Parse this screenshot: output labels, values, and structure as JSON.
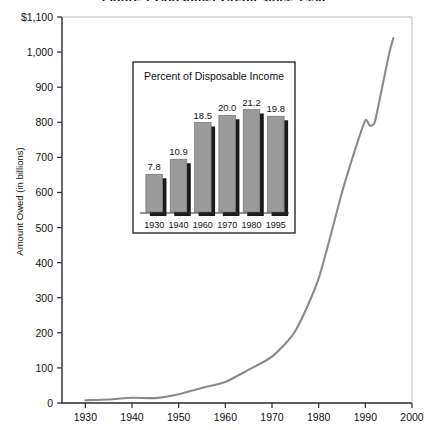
{
  "chart_data": {
    "type": "line",
    "title": "Figure 1   Consumer Credit since 1930",
    "xlabel": "",
    "ylabel": "Amount Owed (in billions)",
    "xlim": [
      1925,
      2000
    ],
    "ylim": [
      0,
      1100
    ],
    "grid": false,
    "legend": null,
    "y_ticks": [
      "$1,100",
      "1,000",
      "900",
      "800",
      "700",
      "600",
      "500",
      "400",
      "300",
      "200",
      "100",
      "0"
    ],
    "y_tick_values": [
      1100,
      1000,
      900,
      800,
      700,
      600,
      500,
      400,
      300,
      200,
      100,
      0
    ],
    "x_ticks": [
      "1930",
      "1940",
      "1950",
      "1960",
      "1970",
      "1980",
      "1990",
      "2000"
    ],
    "x_tick_values": [
      1930,
      1940,
      1950,
      1960,
      1970,
      1980,
      1990,
      2000
    ],
    "series": [
      {
        "name": "Consumer credit outstanding",
        "color": "#8a8a8a",
        "x": [
          1930,
          1935,
          1940,
          1945,
          1950,
          1955,
          1960,
          1965,
          1970,
          1975,
          1980,
          1985,
          1988,
          1990,
          1991,
          1992,
          1993,
          1995,
          1996
        ],
        "values": [
          8,
          10,
          15,
          14,
          25,
          43,
          60,
          95,
          132,
          205,
          355,
          600,
          730,
          805,
          790,
          800,
          860,
          990,
          1040
        ]
      }
    ],
    "inset": {
      "type": "bar",
      "title": "Percent of Disposable Income",
      "categories": [
        "1930",
        "1940",
        "1960",
        "1970",
        "1980",
        "1995"
      ],
      "values": [
        7.8,
        10.9,
        18.5,
        20.0,
        21.2,
        19.8
      ],
      "value_labels": [
        "7.8",
        "10.9",
        "18.5",
        "20.0",
        "21.2",
        "19.8"
      ],
      "bar_color": "#9a9a9a",
      "shadow_color": "#1a1a1a",
      "ylim": [
        0,
        24
      ]
    }
  },
  "colors": {
    "axis": "#2b2b2b",
    "line": "#8a8a8a",
    "background": "#ffffff",
    "inset_border": "#2b2b2b"
  }
}
